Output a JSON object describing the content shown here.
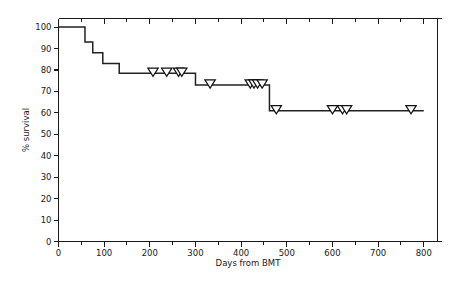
{
  "chart_data": {
    "type": "line",
    "subtype": "kaplan-meier-survival-step",
    "title": "",
    "xlabel": "Days from BMT",
    "ylabel": "% survival",
    "xlim": [
      0,
      830
    ],
    "ylim": [
      0,
      104
    ],
    "grid": false,
    "legend": "none",
    "x_ticks": [
      0,
      100,
      200,
      300,
      400,
      500,
      600,
      700,
      800
    ],
    "x_tick_labels": [
      "0",
      "100",
      "200",
      "300",
      "400",
      "500",
      "600",
      "700",
      "800"
    ],
    "x_minor_step": 50,
    "y_ticks": [
      0,
      10,
      20,
      30,
      40,
      50,
      60,
      70,
      80,
      90,
      100
    ],
    "y_tick_labels": [
      "0",
      "10",
      "20",
      "30",
      "40",
      "50",
      "60",
      "70",
      "80",
      "90",
      "100"
    ],
    "series": [
      {
        "name": "survival",
        "step_points": [
          {
            "x": 0,
            "y": 100
          },
          {
            "x": 58,
            "y": 100
          },
          {
            "x": 58,
            "y": 93
          },
          {
            "x": 75,
            "y": 93
          },
          {
            "x": 75,
            "y": 88
          },
          {
            "x": 97,
            "y": 88
          },
          {
            "x": 97,
            "y": 83
          },
          {
            "x": 133,
            "y": 83
          },
          {
            "x": 133,
            "y": 78.5
          },
          {
            "x": 300,
            "y": 78.5
          },
          {
            "x": 300,
            "y": 73
          },
          {
            "x": 462,
            "y": 73
          },
          {
            "x": 462,
            "y": 61
          },
          {
            "x": 800,
            "y": 61
          }
        ]
      }
    ],
    "censored": [
      {
        "x": 207,
        "y": 78.5
      },
      {
        "x": 237,
        "y": 78.5
      },
      {
        "x": 263,
        "y": 78.5
      },
      {
        "x": 270,
        "y": 78.5
      },
      {
        "x": 332,
        "y": 73
      },
      {
        "x": 420,
        "y": 73
      },
      {
        "x": 428,
        "y": 73
      },
      {
        "x": 436,
        "y": 73
      },
      {
        "x": 446,
        "y": 73
      },
      {
        "x": 477,
        "y": 61
      },
      {
        "x": 600,
        "y": 61
      },
      {
        "x": 622,
        "y": 61
      },
      {
        "x": 631,
        "y": 61
      },
      {
        "x": 772,
        "y": 61
      }
    ],
    "colors": {
      "curve": "#222222",
      "axis": "#1a1a1a",
      "censor_fill": "#ffffff",
      "censor_stroke": "#111111",
      "background": "#ffffff"
    }
  }
}
